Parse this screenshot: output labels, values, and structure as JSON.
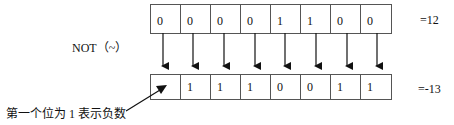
{
  "operation": {
    "label": "NOT（~）"
  },
  "input": {
    "bits": [
      "0",
      "0",
      "0",
      "0",
      "1",
      "1",
      "0",
      "0"
    ],
    "value_label": "=12"
  },
  "output": {
    "bits": [
      "",
      "1",
      "1",
      "1",
      "0",
      "0",
      "1",
      "1"
    ],
    "value_label": "=-13"
  },
  "annotation": {
    "text": "第一个位为 1 表示负数"
  }
}
